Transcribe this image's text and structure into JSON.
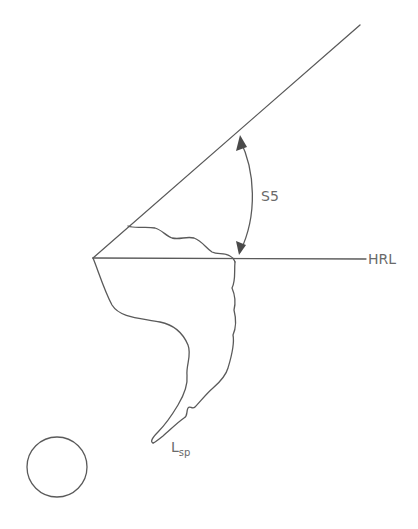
{
  "diagram": {
    "type": "cephalometric angle sketch",
    "labels": {
      "angle": "S5",
      "reference_line": "HRL",
      "tip_main": "L",
      "tip_sub": "sp"
    },
    "colors": {
      "stroke": "#5a5a5a",
      "text": "#6a6a6a",
      "background": "#ffffff"
    },
    "geometry": {
      "vertex": [
        93,
        258
      ],
      "diagonal_end": [
        360,
        25
      ],
      "horizontal_end": [
        366,
        259
      ],
      "circle": {
        "cx": 57,
        "cy": 467,
        "r": 30
      }
    }
  }
}
